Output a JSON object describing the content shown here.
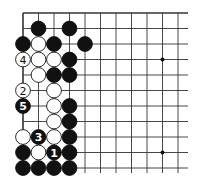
{
  "diagram": {
    "type": "go-board-fragment",
    "origin": {
      "x": 23,
      "y": 13
    },
    "spacing": 15.5,
    "columns": 11,
    "rows": 11,
    "grid_right_x": 188,
    "grid_bottom_y": 173,
    "top_edge_thick": true,
    "left_edge_thick": true,
    "star_points": [
      [
        9,
        3
      ],
      [
        9,
        9
      ]
    ],
    "colors": {
      "black": "#111111",
      "white": "#ffffff",
      "line": "#333333",
      "text_on_black": "#ffffff",
      "text_on_white": "#111111"
    },
    "stones": [
      {
        "col": 1,
        "row": 1,
        "color": "black",
        "label": ""
      },
      {
        "col": 3,
        "row": 1,
        "color": "black",
        "label": ""
      },
      {
        "col": 0,
        "row": 2,
        "color": "black",
        "label": ""
      },
      {
        "col": 1,
        "row": 2,
        "color": "white",
        "label": ""
      },
      {
        "col": 2,
        "row": 2,
        "color": "black",
        "label": ""
      },
      {
        "col": 4,
        "row": 2,
        "color": "black",
        "label": ""
      },
      {
        "col": 0,
        "row": 3,
        "color": "white",
        "label": "4"
      },
      {
        "col": 1,
        "row": 3,
        "color": "white",
        "label": ""
      },
      {
        "col": 2,
        "row": 3,
        "color": "white",
        "label": ""
      },
      {
        "col": 3,
        "row": 3,
        "color": "black",
        "label": ""
      },
      {
        "col": 1,
        "row": 4,
        "color": "white",
        "label": ""
      },
      {
        "col": 2,
        "row": 4,
        "color": "black",
        "label": ""
      },
      {
        "col": 3,
        "row": 4,
        "color": "black",
        "label": ""
      },
      {
        "col": 0,
        "row": 5,
        "color": "white",
        "label": "2"
      },
      {
        "col": 2,
        "row": 5,
        "color": "white",
        "label": ""
      },
      {
        "col": 0,
        "row": 6,
        "color": "black",
        "label": "5"
      },
      {
        "col": 2,
        "row": 6,
        "color": "white",
        "label": ""
      },
      {
        "col": 3,
        "row": 6,
        "color": "black",
        "label": ""
      },
      {
        "col": 2,
        "row": 7,
        "color": "white",
        "label": ""
      },
      {
        "col": 3,
        "row": 7,
        "color": "black",
        "label": ""
      },
      {
        "col": 0,
        "row": 8,
        "color": "white",
        "label": ""
      },
      {
        "col": 1,
        "row": 8,
        "color": "black",
        "label": "3"
      },
      {
        "col": 2,
        "row": 8,
        "color": "white",
        "label": ""
      },
      {
        "col": 3,
        "row": 8,
        "color": "black",
        "label": ""
      },
      {
        "col": 0,
        "row": 9,
        "color": "black",
        "label": ""
      },
      {
        "col": 1,
        "row": 9,
        "color": "white",
        "label": ""
      },
      {
        "col": 2,
        "row": 9,
        "color": "black",
        "label": "1"
      },
      {
        "col": 3,
        "row": 9,
        "color": "black",
        "label": ""
      },
      {
        "col": 0,
        "row": 10,
        "color": "black",
        "label": ""
      },
      {
        "col": 1,
        "row": 10,
        "color": "black",
        "label": ""
      },
      {
        "col": 2,
        "row": 10,
        "color": "black",
        "label": ""
      },
      {
        "col": 3,
        "row": 10,
        "color": "black",
        "label": ""
      }
    ]
  }
}
